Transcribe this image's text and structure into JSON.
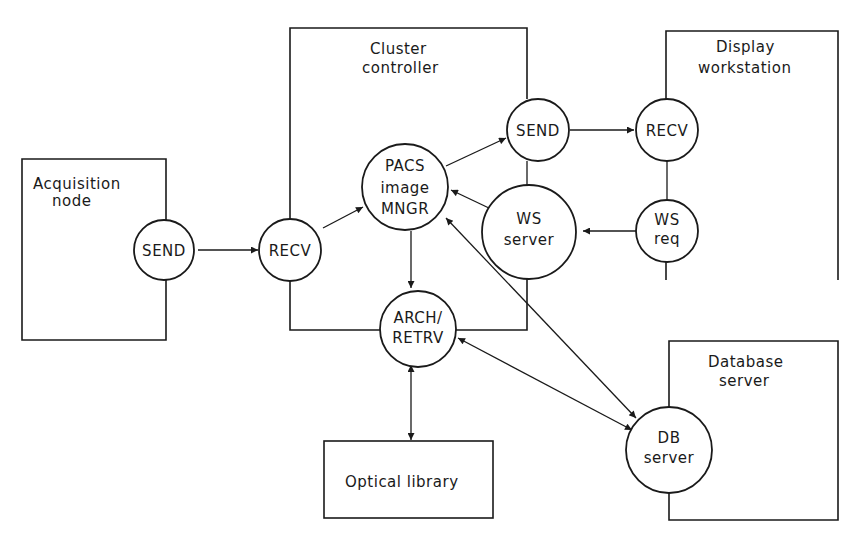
{
  "diagram": {
    "type": "architecture",
    "colors": {
      "stroke": "#1a1a1a",
      "background": "#ffffff"
    },
    "boxes": {
      "acquisition": {
        "label_line1": "Acquisition",
        "label_line2": "node"
      },
      "cluster": {
        "label_line1": "Cluster",
        "label_line2": "controller"
      },
      "display": {
        "label_line1": "Display",
        "label_line2": "workstation"
      },
      "database": {
        "label_line1": "Database",
        "label_line2": "server"
      },
      "optical": {
        "label": "Optical library"
      }
    },
    "nodes": {
      "acq_send": {
        "label": "SEND"
      },
      "cc_recv": {
        "label": "RECV"
      },
      "pacs": {
        "line1": "PACS",
        "line2": "image",
        "line3": "MNGR"
      },
      "cc_send": {
        "label": "SEND"
      },
      "ws_server": {
        "line1": "WS",
        "line2": "server"
      },
      "arch": {
        "line1": "ARCH/",
        "line2": "RETRV"
      },
      "dw_recv": {
        "label": "RECV"
      },
      "ws_req": {
        "line1": "WS",
        "line2": "req"
      },
      "db_server": {
        "line1": "DB",
        "line2": "server"
      }
    },
    "edges": [
      {
        "from": "SEND (Acquisition node)",
        "to": "RECV (Cluster controller)",
        "direction": "forward"
      },
      {
        "from": "RECV (Cluster controller)",
        "to": "PACS image MNGR",
        "direction": "forward"
      },
      {
        "from": "PACS image MNGR",
        "to": "SEND (Cluster controller)",
        "direction": "forward"
      },
      {
        "from": "PACS image MNGR",
        "to": "ARCH/RETRV",
        "direction": "forward"
      },
      {
        "from": "WS server",
        "to": "PACS image MNGR",
        "direction": "forward"
      },
      {
        "from": "SEND (Cluster controller)",
        "to": "RECV (Display workstation)",
        "direction": "forward"
      },
      {
        "from": "WS req",
        "to": "WS server",
        "direction": "forward"
      },
      {
        "from": "PACS image MNGR",
        "to": "DB server",
        "direction": "bidirectional"
      },
      {
        "from": "ARCH/RETRV",
        "to": "DB server",
        "direction": "bidirectional"
      },
      {
        "from": "ARCH/RETRV",
        "to": "Optical library",
        "direction": "bidirectional"
      }
    ]
  }
}
